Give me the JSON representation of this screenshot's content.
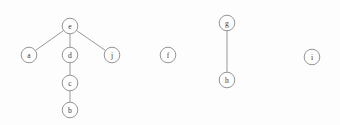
{
  "diagram": {
    "type": "node-link-graph",
    "canvas": {
      "width": 340,
      "height": 125,
      "background": "#fdfdfd"
    },
    "style": {
      "node_radius": 7.8,
      "node_fill": "#fdfdfd",
      "node_stroke": "#8a8a8a",
      "edge_stroke": "#8c8c8c",
      "label_color": "#3a3a3a"
    },
    "nodes": [
      {
        "id": "e",
        "label": "e",
        "x": 70,
        "y": 26
      },
      {
        "id": "a",
        "label": "a",
        "x": 29,
        "y": 55
      },
      {
        "id": "d",
        "label": "d",
        "x": 70,
        "y": 55
      },
      {
        "id": "j",
        "label": "j",
        "x": 112,
        "y": 55
      },
      {
        "id": "c",
        "label": "c",
        "x": 70,
        "y": 83
      },
      {
        "id": "b",
        "label": "b",
        "x": 70,
        "y": 110
      },
      {
        "id": "f",
        "label": "f",
        "x": 168,
        "y": 55
      },
      {
        "id": "g",
        "label": "g",
        "x": 227,
        "y": 23
      },
      {
        "id": "h",
        "label": "h",
        "x": 227,
        "y": 80
      },
      {
        "id": "i",
        "label": "i",
        "x": 312,
        "y": 57
      }
    ],
    "edges": [
      {
        "id": "e-a",
        "source": "e",
        "target": "a"
      },
      {
        "id": "e-d",
        "source": "e",
        "target": "d"
      },
      {
        "id": "e-j",
        "source": "e",
        "target": "j"
      },
      {
        "id": "d-c",
        "source": "d",
        "target": "c"
      },
      {
        "id": "c-b",
        "source": "c",
        "target": "b"
      },
      {
        "id": "g-h",
        "source": "g",
        "target": "h"
      }
    ],
    "components": [
      {
        "name": "tree-component",
        "members": [
          "e",
          "a",
          "d",
          "j",
          "c",
          "b"
        ]
      },
      {
        "name": "isolated-f",
        "members": [
          "f"
        ]
      },
      {
        "name": "pair-component",
        "members": [
          "g",
          "h"
        ]
      },
      {
        "name": "isolated-i",
        "members": [
          "i"
        ]
      }
    ]
  }
}
